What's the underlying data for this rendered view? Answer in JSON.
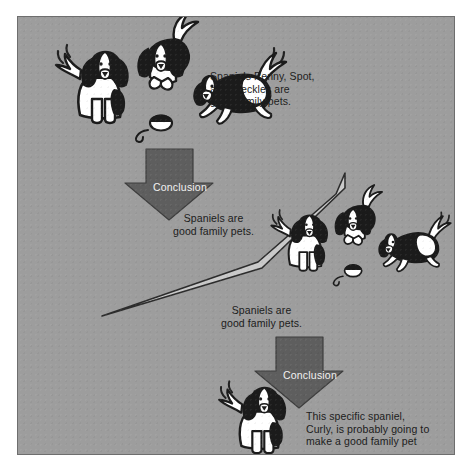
{
  "figure": {
    "background_color": "#9d9d9d",
    "frame_color": "#6e6e6e",
    "arrow_fill": "#5e5e5e",
    "beam_fill": "#c9c9c9",
    "ink_color": "#1b1b1b",
    "arrow_text_color": "#f2f2f2"
  },
  "captions": {
    "premise_1": "Spaniels Penny, Spot,\nand Freckles are\ngood family pets.",
    "conclusion_1": "Spaniels are\ngood family pets.",
    "premise_2": "Spaniels are\ngood family pets.",
    "conclusion_2": "This specific spaniel,\nCurly, is probably going to\nmake a good family pet"
  },
  "arrows": {
    "first": {
      "label": "Conclusion"
    },
    "second": {
      "label": "Conclusion"
    }
  },
  "illustrations": {
    "dog_group_top": "three-spaniels-group-icon",
    "dog_group_middle": "three-spaniels-group-icon",
    "dog_single_bottom": "single-spaniel-icon",
    "beam": "tapered-pointer-beam-icon"
  }
}
